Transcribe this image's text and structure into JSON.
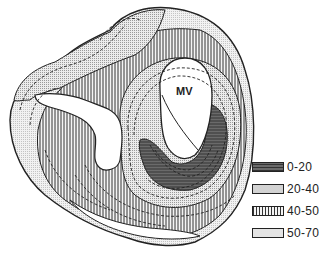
{
  "diagram": {
    "structure_label": "MV",
    "legend": [
      {
        "range": "0-20",
        "pattern": "dark-horizontal-hatch",
        "color": "#555555"
      },
      {
        "range": "20-40",
        "pattern": "fine-dot-stipple",
        "color": "#d8d8d8"
      },
      {
        "range": "40-50",
        "pattern": "vertical-hatch",
        "color": "#888888"
      },
      {
        "range": "50-70",
        "pattern": "light-stipple",
        "color": "#eeeeee"
      }
    ]
  }
}
